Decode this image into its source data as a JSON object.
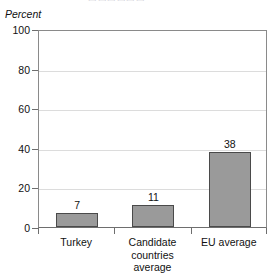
{
  "title_fragment": "▭▭▭▭▭▭",
  "axis_title": "Percent",
  "chart_data": {
    "type": "bar",
    "title": "",
    "xlabel": "",
    "ylabel": "Percent",
    "ylim": [
      0,
      100
    ],
    "yticks": [
      0,
      20,
      40,
      60,
      80,
      100
    ],
    "grid": true,
    "legend": false,
    "categories": [
      [
        "Turkey"
      ],
      [
        "Candidate",
        "countries",
        "average"
      ],
      [
        "EU average"
      ]
    ],
    "category_labels": [
      "Turkey",
      "Candidate countries average",
      "EU average"
    ],
    "values": [
      7,
      11,
      38
    ],
    "value_labels": [
      "7",
      "11",
      "38"
    ],
    "colors": {
      "bar_fill": "#9a9a9a",
      "bar_border": "#4a4a4a",
      "gridline": "#dcdcdc",
      "axis": "#6e6e6e",
      "text": "#111111"
    }
  }
}
